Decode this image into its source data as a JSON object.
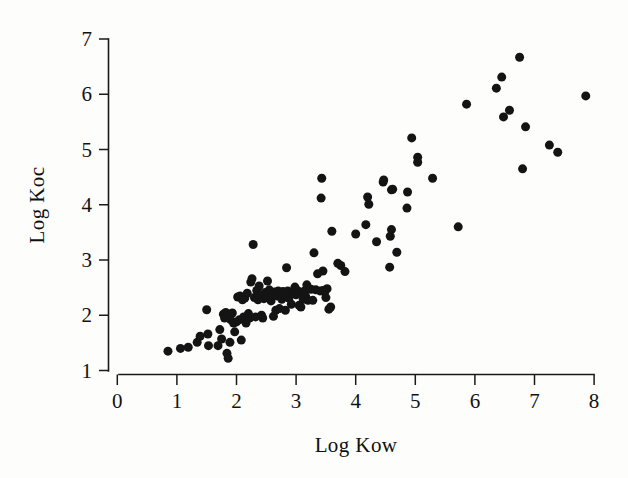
{
  "chart_data": {
    "type": "scatter",
    "title": "",
    "xlabel": "Log Kow",
    "ylabel": "Log Koc",
    "xlim": [
      0,
      8
    ],
    "ylim": [
      1,
      7
    ],
    "xticks": [
      0,
      1,
      2,
      3,
      4,
      5,
      6,
      7,
      8
    ],
    "yticks": [
      1,
      2,
      3,
      4,
      5,
      6,
      7
    ],
    "xtick_labels": [
      "0",
      "1",
      "2",
      "3",
      "4",
      "5",
      "6",
      "7",
      "8"
    ],
    "ytick_labels": [
      "1",
      "2",
      "3",
      "4",
      "5",
      "6",
      "7"
    ],
    "grid": false,
    "legend": false,
    "marker": "filled-circle",
    "marker_color": "#141414",
    "marker_size_px": 9,
    "n_points": 118,
    "series": [
      {
        "name": "compounds",
        "points": [
          [
            0.85,
            1.35
          ],
          [
            1.06,
            1.4
          ],
          [
            1.19,
            1.42
          ],
          [
            1.34,
            1.51
          ],
          [
            1.39,
            1.62
          ],
          [
            1.53,
            1.45
          ],
          [
            1.52,
            1.66
          ],
          [
            1.5,
            2.1
          ],
          [
            1.69,
            1.45
          ],
          [
            1.72,
            1.74
          ],
          [
            1.75,
            1.57
          ],
          [
            1.78,
            2.02
          ],
          [
            1.8,
            1.95
          ],
          [
            1.82,
            2.05
          ],
          [
            1.84,
            1.31
          ],
          [
            1.86,
            1.22
          ],
          [
            1.89,
            1.51
          ],
          [
            1.9,
            1.92
          ],
          [
            1.93,
            2.04
          ],
          [
            1.95,
            1.86
          ],
          [
            1.97,
            1.7
          ],
          [
            2.0,
            1.88
          ],
          [
            2.02,
            2.33
          ],
          [
            2.05,
            1.92
          ],
          [
            2.06,
            2.35
          ],
          [
            2.08,
            1.55
          ],
          [
            2.1,
            2.28
          ],
          [
            2.12,
            1.97
          ],
          [
            2.14,
            2.31
          ],
          [
            2.16,
            1.86
          ],
          [
            2.18,
            2.4
          ],
          [
            2.2,
            2.03
          ],
          [
            2.22,
            1.95
          ],
          [
            2.24,
            2.6
          ],
          [
            2.26,
            2.66
          ],
          [
            2.28,
            3.28
          ],
          [
            2.3,
            2.32
          ],
          [
            2.32,
            1.97
          ],
          [
            2.34,
            2.45
          ],
          [
            2.36,
            2.28
          ],
          [
            2.38,
            2.53
          ],
          [
            2.4,
            2.36
          ],
          [
            2.42,
            2.0
          ],
          [
            2.44,
            1.95
          ],
          [
            2.46,
            2.3
          ],
          [
            2.48,
            2.41
          ],
          [
            2.5,
            2.33
          ],
          [
            2.52,
            2.62
          ],
          [
            2.55,
            2.46
          ],
          [
            2.58,
            2.26
          ],
          [
            2.6,
            2.38
          ],
          [
            2.62,
            1.98
          ],
          [
            2.64,
            2.42
          ],
          [
            2.66,
            2.09
          ],
          [
            2.68,
            2.35
          ],
          [
            2.7,
            2.44
          ],
          [
            2.72,
            2.12
          ],
          [
            2.74,
            2.4
          ],
          [
            2.76,
            2.29
          ],
          [
            2.78,
            2.43
          ],
          [
            2.8,
            2.36
          ],
          [
            2.82,
            2.09
          ],
          [
            2.84,
            2.86
          ],
          [
            2.86,
            2.44
          ],
          [
            2.88,
            2.31
          ],
          [
            2.9,
            2.4
          ],
          [
            2.92,
            2.2
          ],
          [
            2.95,
            2.43
          ],
          [
            2.98,
            2.51
          ],
          [
            3.0,
            2.37
          ],
          [
            3.02,
            2.45
          ],
          [
            3.05,
            2.18
          ],
          [
            3.08,
            2.15
          ],
          [
            3.1,
            2.41
          ],
          [
            3.12,
            2.29
          ],
          [
            3.14,
            2.44
          ],
          [
            3.16,
            2.34
          ],
          [
            3.18,
            2.55
          ],
          [
            3.2,
            2.27
          ],
          [
            3.25,
            2.47
          ],
          [
            3.28,
            2.27
          ],
          [
            3.3,
            3.13
          ],
          [
            3.33,
            2.46
          ],
          [
            3.36,
            2.75
          ],
          [
            3.4,
            2.44
          ],
          [
            3.42,
            4.12
          ],
          [
            3.43,
            4.48
          ],
          [
            3.45,
            2.45
          ],
          [
            3.45,
            2.8
          ],
          [
            3.48,
            2.42
          ],
          [
            3.5,
            2.32
          ],
          [
            3.52,
            2.48
          ],
          [
            3.55,
            2.11
          ],
          [
            3.58,
            2.15
          ],
          [
            3.6,
            3.52
          ],
          [
            3.7,
            2.94
          ],
          [
            3.75,
            2.9
          ],
          [
            3.82,
            2.79
          ],
          [
            4.0,
            3.47
          ],
          [
            4.17,
            3.64
          ],
          [
            4.2,
            4.14
          ],
          [
            4.22,
            4.01
          ],
          [
            4.35,
            3.33
          ],
          [
            4.46,
            4.41
          ],
          [
            4.47,
            4.45
          ],
          [
            4.57,
            2.87
          ],
          [
            4.58,
            3.43
          ],
          [
            4.6,
            3.55
          ],
          [
            4.6,
            4.27
          ],
          [
            4.62,
            4.28
          ],
          [
            4.69,
            3.14
          ],
          [
            4.86,
            3.94
          ],
          [
            4.87,
            4.23
          ],
          [
            4.94,
            5.21
          ],
          [
            5.04,
            4.86
          ],
          [
            5.04,
            4.77
          ],
          [
            5.29,
            4.48
          ],
          [
            5.72,
            3.6
          ],
          [
            5.86,
            5.82
          ],
          [
            6.36,
            6.11
          ],
          [
            6.45,
            6.31
          ],
          [
            6.48,
            5.59
          ],
          [
            6.58,
            5.71
          ],
          [
            6.75,
            6.67
          ],
          [
            6.8,
            4.65
          ],
          [
            6.85,
            5.41
          ],
          [
            7.25,
            5.08
          ],
          [
            7.39,
            4.95
          ],
          [
            7.86,
            5.97
          ]
        ]
      }
    ]
  },
  "figure": {
    "background_color": "#fdfdfc",
    "axis_color": "#1a1a1a",
    "point_color": "#141414"
  }
}
